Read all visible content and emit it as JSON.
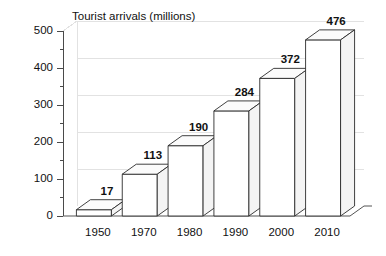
{
  "chart_data": {
    "type": "bar",
    "title": "Tourist arrivals (millions)",
    "xlabel": "",
    "ylabel": "",
    "categories": [
      "1950",
      "1970",
      "1980",
      "1990",
      "2000",
      "2010"
    ],
    "values": [
      17,
      113,
      190,
      284,
      372,
      476
    ],
    "value_labels": [
      "17",
      "113",
      "190",
      "284",
      "372",
      "476"
    ],
    "ylim": [
      0,
      500
    ],
    "y_ticks": [
      0,
      100,
      200,
      300,
      400,
      500
    ],
    "y_tick_labels": [
      "0",
      "100",
      "200",
      "300",
      "400",
      "500"
    ],
    "y_minor_tick_step": 50,
    "grid": true,
    "legend": "none",
    "style": "3d-bars",
    "colors": {
      "bar_face": "#ffffff",
      "bar_top": "#fbfbfb",
      "bar_side": "#f4f4f4",
      "bar_outline": "#2b2b2b",
      "axis": "#4a4a4a",
      "grid": "#e2e2e2",
      "text": "#111111"
    }
  }
}
